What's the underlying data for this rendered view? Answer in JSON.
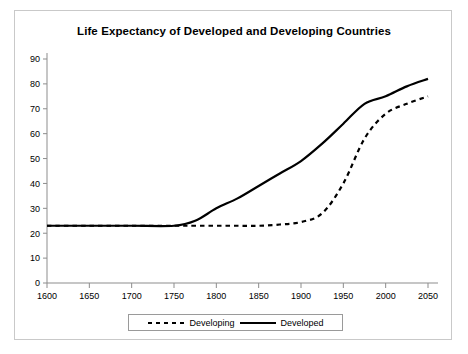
{
  "chart_data": {
    "type": "line",
    "title": "Life Expectancy of Developed and Developing Countries",
    "xlabel": "",
    "ylabel": "",
    "xlim": [
      1600,
      2050
    ],
    "ylim": [
      0,
      90
    ],
    "grid": false,
    "legend_position": "bottom",
    "x_ticks": [
      1600,
      1650,
      1700,
      1750,
      1800,
      1850,
      1900,
      1950,
      2000,
      2050
    ],
    "y_ticks": [
      0,
      10,
      20,
      30,
      40,
      50,
      60,
      70,
      80,
      90
    ],
    "x": [
      1600,
      1650,
      1700,
      1750,
      1775,
      1800,
      1825,
      1850,
      1875,
      1900,
      1925,
      1950,
      1975,
      2000,
      2025,
      2050
    ],
    "series": [
      {
        "name": "Developing",
        "style": "dashed",
        "color": "#000000",
        "values": [
          23,
          23,
          23,
          23,
          23,
          23,
          23,
          23,
          23.5,
          24.5,
          28,
          40,
          58,
          68,
          72,
          75
        ]
      },
      {
        "name": "Developed",
        "style": "solid",
        "color": "#000000",
        "values": [
          23,
          23,
          23,
          23,
          25,
          30,
          34,
          39,
          44,
          49,
          56,
          64,
          72,
          75,
          79,
          82
        ]
      }
    ]
  },
  "legend": {
    "items": [
      {
        "label": "Developing",
        "style": "dashed"
      },
      {
        "label": "Developed",
        "style": "solid"
      }
    ]
  }
}
